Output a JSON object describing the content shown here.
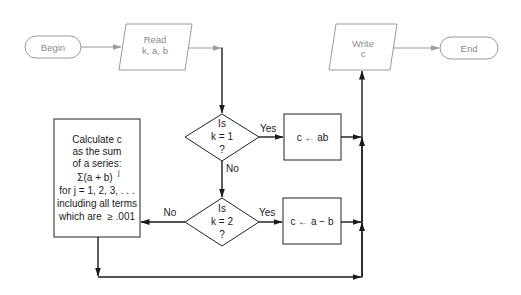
{
  "flowchart": {
    "begin": {
      "label": "Begin"
    },
    "read": {
      "line1": "Read",
      "line2": "k, a, b"
    },
    "decision1": {
      "line1": "Is",
      "line2": "k = 1",
      "line3": "?",
      "yes_label": "Yes",
      "no_label": "No"
    },
    "assign1": {
      "label": "c ← ab"
    },
    "decision2": {
      "line1": "Is",
      "line2": "k = 2",
      "line3": "?",
      "yes_label": "Yes",
      "no_label": "No"
    },
    "assign2": {
      "label": "c ← a − b"
    },
    "calculate": {
      "lines": [
        "Calculate c",
        "as the sum",
        "of a series:",
        "Σ(a + b)",
        "for j = 1, 2, 3, . . .",
        "including all terms",
        "which are  ≥ .001"
      ],
      "exponent": "j"
    },
    "write": {
      "line1": "Write",
      "line2": "c"
    },
    "end": {
      "label": "End"
    }
  },
  "colors": {
    "io_terminal_stroke": "#9a9a9a",
    "process_stroke": "#222222",
    "background": "#ffffff"
  }
}
